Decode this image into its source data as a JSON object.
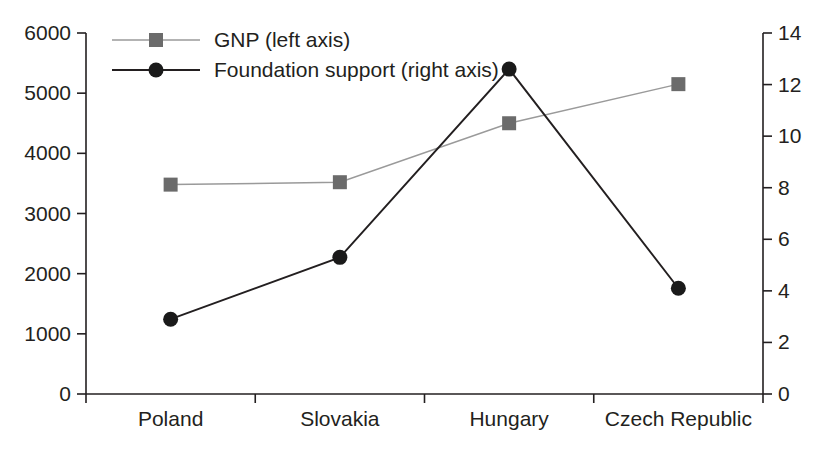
{
  "chart_data": {
    "type": "line",
    "title": "",
    "subtitle": "",
    "xlabel": "",
    "categories": [
      "Poland",
      "Slovakia",
      "Hungary",
      "Czech Republic"
    ],
    "grid": false,
    "legend_position": "top-left",
    "axes": {
      "left": {
        "label": "GNP",
        "ylim": [
          0,
          6000
        ],
        "ticks": [
          0,
          1000,
          2000,
          3000,
          4000,
          5000,
          6000
        ],
        "tick_labels": [
          "0",
          "1000",
          "2000",
          "3000",
          "4000",
          "5000",
          "6000"
        ]
      },
      "right": {
        "label": "Foundation support",
        "ylim": [
          0,
          14
        ],
        "ticks": [
          0,
          2,
          4,
          6,
          8,
          10,
          12,
          14
        ],
        "tick_labels": [
          "0",
          "2",
          "4",
          "6",
          "8",
          "10",
          "12",
          "14"
        ]
      }
    },
    "series": [
      {
        "name": "GNP (left axis)",
        "axis": "left",
        "marker": "square",
        "color": "#6b6b6b",
        "line_color": "#9a9a9a",
        "values": [
          3480,
          3520,
          4500,
          5150
        ]
      },
      {
        "name": "Foundation support (right axis)",
        "axis": "right",
        "marker": "circle",
        "color": "#1a1a1a",
        "line_color": "#231f20",
        "values": [
          2.9,
          5.3,
          12.6,
          4.1
        ]
      }
    ],
    "legend": [
      {
        "label": "GNP (left axis)",
        "marker": "square",
        "color": "#6b6b6b",
        "line_color": "#9a9a9a"
      },
      {
        "label": "Foundation support (right axis)",
        "marker": "circle",
        "color": "#1a1a1a",
        "line_color": "#231f20"
      }
    ]
  }
}
